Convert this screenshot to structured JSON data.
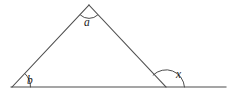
{
  "figure": {
    "background_color": "#ffffff",
    "line_color": "#4d4d4d",
    "label_color": "#1a1a1a",
    "labels": {
      "apex_angle": "a",
      "left_base_angle": "b",
      "exterior_angle": "x"
    },
    "points": {
      "left_vertex": "12,87",
      "apex_vertex": "89,5",
      "right_vertex": "166,87",
      "baseline_start": "11,87",
      "baseline_end": "226,87"
    },
    "label_positions": {
      "apex_angle": "84,26",
      "left_base_angle": "27,84",
      "exterior_angle": "176,78"
    },
    "geometry": {
      "shape": "triangle",
      "base_extended": true,
      "arc_count": 3
    }
  }
}
